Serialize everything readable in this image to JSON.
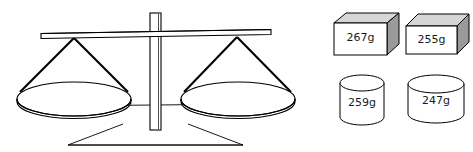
{
  "figure": {
    "kind": "balance-scale-and-weights-diagram",
    "background_color": "#ffffff",
    "outline_color": "#000000"
  },
  "balance": {
    "name": "balance-scale",
    "state": "level",
    "parts": {
      "beam": "beam",
      "post": "post",
      "base": "base",
      "crossbar": "crossbar",
      "left_pan": "left-pan",
      "right_pan": "right-pan",
      "left_strings": "left-hanging-strings",
      "right_strings": "right-hanging-strings"
    }
  },
  "weights": {
    "rows": [
      {
        "shape": "box",
        "items": [
          {
            "label": "267g",
            "value": 267,
            "unit": "g"
          },
          {
            "label": "255g",
            "value": 255,
            "unit": "g"
          }
        ]
      },
      {
        "shape": "cylinder",
        "items": [
          {
            "label": "259g",
            "value": 259,
            "unit": "g"
          },
          {
            "label": "247g",
            "value": 247,
            "unit": "g"
          }
        ]
      }
    ]
  },
  "colors": {
    "box_front": "#ffffff",
    "box_top": "#d6d6d6",
    "box_side": "#9a9a9a",
    "cylinder_body": "#ffffff",
    "stroke": "#000000",
    "label_text": "#1a1a1a"
  }
}
